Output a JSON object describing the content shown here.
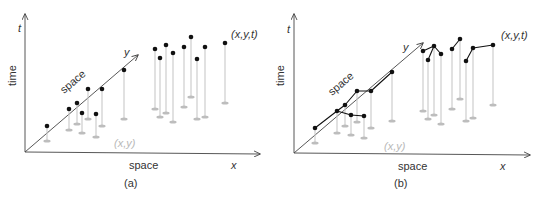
{
  "colors": {
    "axis": "#444444",
    "point": "#111111",
    "stem": "#c8c8c8",
    "shadow": "#bdbdbd",
    "trajectory": "#111111",
    "projection_label": "#b8b8b8",
    "text": "#333333"
  },
  "panels": [
    {
      "id": "a",
      "caption": "(a)",
      "labels": {
        "t_axis": "t",
        "time": "time",
        "y_axis": "y",
        "space_diag": "space",
        "space_x": "space",
        "x_axis": "x",
        "point_label": "(x,y,t)",
        "projection_label": "(x,y)"
      },
      "connected": false
    },
    {
      "id": "b",
      "caption": "(b)",
      "labels": {
        "t_axis": "t",
        "time": "time",
        "y_axis": "y",
        "space_diag": "space",
        "space_x": "space",
        "x_axis": "x",
        "point_label": "(x,y,t)",
        "projection_label": "(x,y)"
      },
      "connected": true
    }
  ],
  "diagram": {
    "panel_a_points": [
      {
        "p": [
          47,
          126
        ],
        "s": [
          47,
          141
        ]
      },
      {
        "p": [
          69,
          109
        ],
        "s": [
          69,
          130
        ]
      },
      {
        "p": [
          77,
          103
        ],
        "s": [
          77,
          124
        ]
      },
      {
        "p": [
          82,
          113
        ],
        "s": [
          82,
          133
        ]
      },
      {
        "p": [
          88,
          89
        ],
        "s": [
          88,
          119
        ]
      },
      {
        "p": [
          96,
          114
        ],
        "s": [
          96,
          137
        ]
      },
      {
        "p": [
          102,
          89
        ],
        "s": [
          102,
          126
        ]
      },
      {
        "p": [
          124,
          70
        ],
        "s": [
          124,
          119
        ]
      },
      {
        "p": [
          155,
          49
        ],
        "s": [
          155,
          109
        ]
      },
      {
        "p": [
          160,
          58
        ],
        "s": [
          160,
          117
        ]
      },
      {
        "p": [
          166,
          45
        ],
        "s": [
          166,
          113
        ]
      },
      {
        "p": [
          173,
          53
        ],
        "s": [
          173,
          122
        ]
      },
      {
        "p": [
          184,
          47
        ],
        "s": [
          184,
          107
        ]
      },
      {
        "p": [
          191,
          37
        ],
        "s": [
          191,
          97
        ]
      },
      {
        "p": [
          197,
          59
        ],
        "s": [
          197,
          119
        ]
      },
      {
        "p": [
          205,
          47
        ],
        "s": [
          205,
          117
        ]
      },
      {
        "p": [
          225,
          43
        ],
        "s": [
          225,
          103
        ]
      }
    ],
    "panel_b_points": [
      {
        "p": [
          315,
          128
        ],
        "s": [
          315,
          143
        ]
      },
      {
        "p": [
          337,
          111
        ],
        "s": [
          337,
          133
        ]
      },
      {
        "p": [
          345,
          105
        ],
        "s": [
          345,
          126
        ]
      },
      {
        "p": [
          351,
          115
        ],
        "s": [
          351,
          135
        ]
      },
      {
        "p": [
          357,
          91
        ],
        "s": [
          357,
          122
        ]
      },
      {
        "p": [
          364,
          116
        ],
        "s": [
          364,
          138
        ]
      },
      {
        "p": [
          371,
          91
        ],
        "s": [
          371,
          128
        ]
      },
      {
        "p": [
          392,
          72
        ],
        "s": [
          392,
          121
        ]
      },
      {
        "p": [
          423,
          51
        ],
        "s": [
          423,
          111
        ]
      },
      {
        "p": [
          428,
          60
        ],
        "s": [
          428,
          119
        ]
      },
      {
        "p": [
          434,
          46
        ],
        "s": [
          434,
          115
        ]
      },
      {
        "p": [
          441,
          54
        ],
        "s": [
          441,
          124
        ]
      },
      {
        "p": [
          452,
          49
        ],
        "s": [
          452,
          109
        ]
      },
      {
        "p": [
          460,
          39
        ],
        "s": [
          460,
          99
        ]
      },
      {
        "p": [
          466,
          61
        ],
        "s": [
          466,
          121
        ]
      },
      {
        "p": [
          473,
          48
        ],
        "s": [
          473,
          118
        ]
      },
      {
        "p": [
          493,
          45
        ],
        "s": [
          493,
          105
        ]
      }
    ],
    "panel_b_trajectories": [
      [
        [
          315,
          128
        ],
        [
          337,
          111
        ],
        [
          345,
          105
        ],
        [
          357,
          91
        ],
        [
          371,
          91
        ],
        [
          392,
          72
        ]
      ],
      [
        [
          337,
          111
        ],
        [
          351,
          115
        ],
        [
          364,
          116
        ]
      ],
      [
        [
          423,
          51
        ],
        [
          434,
          46
        ],
        [
          441,
          54
        ]
      ],
      [
        [
          428,
          60
        ],
        [
          434,
          46
        ]
      ],
      [
        [
          452,
          49
        ],
        [
          460,
          39
        ]
      ],
      [
        [
          466,
          61
        ],
        [
          473,
          48
        ],
        [
          493,
          45
        ]
      ]
    ]
  }
}
